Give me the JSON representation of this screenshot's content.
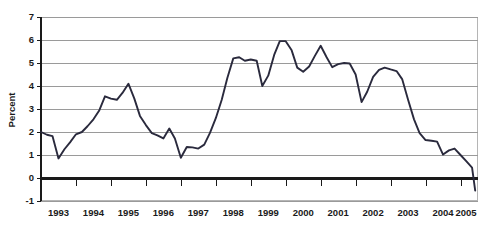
{
  "chart_data": {
    "type": "line",
    "title": "",
    "subtitle": "",
    "xlabel": "",
    "ylabel": "Percent",
    "ylim": [
      -1,
      7
    ],
    "xlim": [
      1993.0,
      2005.5
    ],
    "yticks": [
      -1,
      0,
      1,
      2,
      3,
      4,
      5,
      6,
      7
    ],
    "ytick_labels": [
      "-1",
      "0",
      "1",
      "2",
      "3",
      "4",
      "5",
      "6",
      "7"
    ],
    "categories": [
      "1993",
      "1994",
      "1995",
      "1996",
      "1997",
      "1998",
      "1999",
      "2000",
      "2001",
      "2002",
      "2003",
      "2004",
      "2005"
    ],
    "xtick_labels": [
      "1993",
      "1994",
      "1995",
      "1996",
      "1997",
      "1998",
      "1999",
      "2000",
      "2001",
      "2002",
      "2003",
      "2004",
      "2005"
    ],
    "grid": true,
    "grid_axis": "y",
    "legend": false,
    "legend_position": "none",
    "zero_line": true,
    "line_color": "#2a2a3d",
    "grid_color": "#9a9a9a",
    "axis_color": "#1a1a1a",
    "background_color": "#ffffff",
    "series": [
      {
        "name": "Percent",
        "x": [
          1993.0,
          1993.17,
          1993.33,
          1993.5,
          1993.67,
          1993.83,
          1994.0,
          1994.17,
          1994.33,
          1994.5,
          1994.67,
          1994.83,
          1995.0,
          1995.17,
          1995.33,
          1995.5,
          1995.67,
          1995.83,
          1996.0,
          1996.17,
          1996.33,
          1996.5,
          1996.67,
          1996.83,
          1997.0,
          1997.17,
          1997.33,
          1997.5,
          1997.67,
          1997.83,
          1998.0,
          1998.17,
          1998.33,
          1998.5,
          1998.67,
          1998.83,
          1999.0,
          1999.17,
          1999.33,
          1999.5,
          1999.67,
          1999.83,
          2000.0,
          2000.17,
          2000.33,
          2000.5,
          2000.67,
          2000.83,
          2001.0,
          2001.17,
          2001.33,
          2001.5,
          2001.67,
          2001.83,
          2002.0,
          2002.17,
          2002.33,
          2002.5,
          2002.67,
          2002.83,
          2003.0,
          2003.17,
          2003.33,
          2003.5,
          2003.67,
          2003.83,
          2004.0,
          2004.17,
          2004.33,
          2004.5,
          2004.67,
          2004.83,
          2005.0,
          2005.17,
          2005.33,
          2005.42
        ],
        "values": [
          2.0,
          1.88,
          1.82,
          0.85,
          1.25,
          1.55,
          1.9,
          2.0,
          2.25,
          2.55,
          2.95,
          3.55,
          3.45,
          3.4,
          3.7,
          4.1,
          3.45,
          2.7,
          2.3,
          1.95,
          1.85,
          1.72,
          2.15,
          1.72,
          0.88,
          1.35,
          1.33,
          1.28,
          1.45,
          1.95,
          2.6,
          3.4,
          4.35,
          5.2,
          5.25,
          5.1,
          5.15,
          5.1,
          4.0,
          4.45,
          5.35,
          5.95,
          5.95,
          5.55,
          4.8,
          4.62,
          4.85,
          5.3,
          5.75,
          5.25,
          4.82,
          4.95,
          5.0,
          4.98,
          4.5,
          3.3,
          3.75,
          4.4,
          4.7,
          4.8,
          4.72,
          4.65,
          4.3,
          3.4,
          2.55,
          1.95,
          1.65,
          1.62,
          1.58,
          1.02,
          1.2,
          1.28,
          1.0,
          0.72,
          0.45,
          -0.55
        ]
      }
    ]
  },
  "axis": {
    "y_title": "Percent"
  }
}
